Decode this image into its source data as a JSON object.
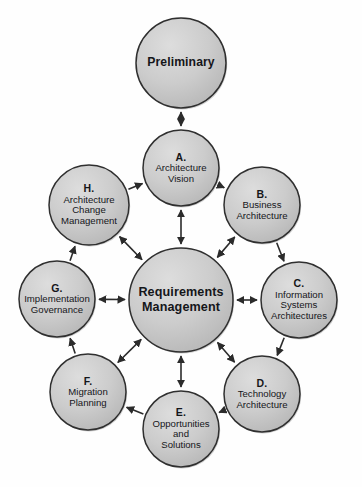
{
  "diagram": {
    "background_color": "#fefefe",
    "node_fill_color": "#c9c9c9",
    "node_fill_highlight": "#dcdcdc",
    "node_border_color": "#2f2f2f",
    "arrow_color": "#2b2b2b",
    "text_color": "#15161a"
  },
  "nodes": {
    "preliminary": {
      "id": "preliminary",
      "letter": "",
      "title": "Preliminary",
      "lines": [
        "Preliminary"
      ],
      "cx": 181,
      "cy": 63,
      "r": 45,
      "bold": true
    },
    "center": {
      "id": "requirements-management",
      "letter": "",
      "title": "Requirements Management",
      "lines": [
        "Requirements",
        "Management"
      ],
      "cx": 181,
      "cy": 300,
      "r": 52,
      "bold": true
    },
    "a": {
      "id": "phase-a",
      "letter": "A.",
      "title": "Architecture Vision",
      "lines": [
        "Architecture",
        "Vision"
      ],
      "cx": 181,
      "cy": 168,
      "r": 38,
      "bold": false
    },
    "b": {
      "id": "phase-b",
      "letter": "B.",
      "title": "Business Architecture",
      "lines": [
        "Business",
        "Architecture"
      ],
      "cx": 262,
      "cy": 205,
      "r": 38,
      "bold": false
    },
    "c": {
      "id": "phase-c",
      "letter": "C.",
      "title": "Information Systems Architectures",
      "lines": [
        "Information",
        "Systems",
        "Architectures"
      ],
      "cx": 299,
      "cy": 300,
      "r": 38,
      "bold": false
    },
    "d": {
      "id": "phase-d",
      "letter": "D.",
      "title": "Technology Architecture",
      "lines": [
        "Technology",
        "Architecture"
      ],
      "cx": 262,
      "cy": 394,
      "r": 38,
      "bold": false
    },
    "e": {
      "id": "phase-e",
      "letter": "E.",
      "title": "Opportunities and Solutions",
      "lines": [
        "Opportunities",
        "and",
        "Solutions"
      ],
      "cx": 181,
      "cy": 429,
      "r": 38,
      "bold": false
    },
    "f": {
      "id": "phase-f",
      "letter": "F.",
      "title": "Migration Planning",
      "lines": [
        "Migration",
        "Planning"
      ],
      "cx": 88,
      "cy": 392,
      "r": 38,
      "bold": false
    },
    "g": {
      "id": "phase-g",
      "letter": "G.",
      "title": "Implementation Governance",
      "lines": [
        "Implementation",
        "Governance"
      ],
      "cx": 57,
      "cy": 299,
      "r": 38,
      "bold": false
    },
    "h": {
      "id": "phase-h",
      "letter": "H.",
      "title": "Architecture Change Management",
      "lines": [
        "Architecture",
        "Change",
        "Management"
      ],
      "cx": 89,
      "cy": 205,
      "r": 40,
      "bold": false
    }
  },
  "edges": {
    "ring": [
      {
        "from": "a",
        "to": "b",
        "style": "single"
      },
      {
        "from": "b",
        "to": "c",
        "style": "single"
      },
      {
        "from": "c",
        "to": "d",
        "style": "single"
      },
      {
        "from": "d",
        "to": "e",
        "style": "single"
      },
      {
        "from": "e",
        "to": "f",
        "style": "single"
      },
      {
        "from": "f",
        "to": "g",
        "style": "single"
      },
      {
        "from": "g",
        "to": "h",
        "style": "single"
      },
      {
        "from": "h",
        "to": "a",
        "style": "single"
      }
    ],
    "spokes": [
      {
        "from": "a",
        "to": "center",
        "style": "double"
      },
      {
        "from": "b",
        "to": "center",
        "style": "double"
      },
      {
        "from": "c",
        "to": "center",
        "style": "double"
      },
      {
        "from": "d",
        "to": "center",
        "style": "double"
      },
      {
        "from": "e",
        "to": "center",
        "style": "double"
      },
      {
        "from": "f",
        "to": "center",
        "style": "double"
      },
      {
        "from": "g",
        "to": "center",
        "style": "double"
      },
      {
        "from": "h",
        "to": "center",
        "style": "double"
      }
    ],
    "vertical": [
      {
        "from": "preliminary",
        "to": "a",
        "style": "double"
      }
    ]
  }
}
